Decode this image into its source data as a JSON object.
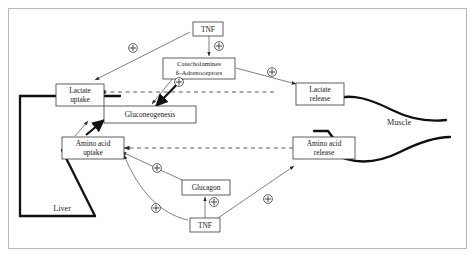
{
  "figure": {
    "frame_color": "#b9b9b9",
    "background": "#ffffff"
  },
  "tissues": [
    {
      "name": "liver-label",
      "label": "Liver",
      "x": 62,
      "y": 209
    },
    {
      "name": "muscle-label",
      "label": "Muscle",
      "x": 399,
      "y": 123
    }
  ],
  "nodes": [
    {
      "name": "tnf-top",
      "id": "tnf_top",
      "label": "TNF",
      "lines": [
        "TNF"
      ],
      "x": 193,
      "y": 22,
      "w": 30,
      "h": 14
    },
    {
      "name": "catecholamines",
      "id": "catecholamines",
      "label": "Catecholamines ß-Adrenoceptors",
      "lines": [
        "Catecholamines",
        "ß-Adrenoceptors"
      ],
      "x": 163,
      "y": 58,
      "w": 72,
      "h": 21
    },
    {
      "name": "lactate-uptake",
      "id": "lactate_uptake",
      "label": "Lactate uptake",
      "lines": [
        "Lactate",
        "uptake"
      ],
      "x": 68,
      "y": 84,
      "w": 48,
      "h": 22
    },
    {
      "name": "lactate-release",
      "id": "lactate_release",
      "label": "Lactate release",
      "lines": [
        "Lactate",
        "release"
      ],
      "x": 300,
      "y": 83,
      "w": 48,
      "h": 22
    },
    {
      "name": "gluconeogenesis",
      "id": "gluconeogenesis",
      "label": "Gluconeogenesis",
      "lines": [
        "Gluconeogenesis"
      ],
      "x": 102,
      "y": 110,
      "w": 92,
      "h": 17
    },
    {
      "name": "amino-acid-uptake",
      "id": "aa_uptake",
      "label": "Amino acid uptake",
      "lines": [
        "Amino acid",
        "uptake"
      ],
      "x": 58,
      "y": 139,
      "w": 62,
      "h": 22
    },
    {
      "name": "amino-acid-release",
      "id": "aa_release",
      "label": "Amino acid release",
      "lines": [
        "Amino acid",
        "release"
      ],
      "x": 297,
      "y": 139,
      "w": 62,
      "h": 22
    },
    {
      "name": "glucagon",
      "id": "glucagon",
      "label": "Glucagon",
      "lines": [
        "Glucagon"
      ],
      "x": 183,
      "y": 182,
      "w": 48,
      "h": 15
    },
    {
      "name": "tnf-bottom",
      "id": "tnf_bottom",
      "label": "TNF",
      "lines": [
        "TNF"
      ],
      "x": 190,
      "y": 220,
      "w": 30,
      "h": 14
    }
  ],
  "markers": [
    {
      "name": "plus-marker-tnf-to-lactate-uptake",
      "symbol": "+",
      "x": 133,
      "y": 48
    },
    {
      "name": "plus-marker-tnf-to-catecholamines",
      "symbol": "+",
      "x": 210,
      "y": 56
    },
    {
      "name": "plus-marker-catecholamines-to-muscle",
      "symbol": "+",
      "x": 272,
      "y": 72
    },
    {
      "name": "plus-marker-catecholamines-to-gluconeo",
      "symbol": "+",
      "x": 179,
      "y": 82
    },
    {
      "name": "plus-marker-glucagon-to-aa-uptake",
      "symbol": "+",
      "x": 157,
      "y": 168
    },
    {
      "name": "plus-marker-tnf-to-glucagon",
      "symbol": "+",
      "x": 209,
      "y": 200
    },
    {
      "name": "plus-marker-tnf-to-aa-uptake",
      "symbol": "+",
      "x": 156,
      "y": 208
    },
    {
      "name": "plus-marker-tnf-to-aa-release",
      "symbol": "+",
      "x": 268,
      "y": 199
    }
  ],
  "connections": [
    {
      "name": "edge-tnf-to-lactate-uptake",
      "from": "tnf_top",
      "to": "lactate_uptake",
      "style": "solid-thin",
      "sign": "+"
    },
    {
      "name": "edge-tnf-to-catecholamines",
      "from": "tnf_top",
      "to": "catecholamines",
      "style": "solid-thin",
      "sign": "+"
    },
    {
      "name": "edge-catecholamines-to-lactate-release",
      "from": "catecholamines",
      "to": "lactate_release",
      "style": "solid-thin",
      "sign": "+"
    },
    {
      "name": "edge-catecholamines-to-gluconeogenesis",
      "from": "catecholamines",
      "to": "gluconeogenesis",
      "style": "solid-thick",
      "sign": "+"
    },
    {
      "name": "edge-lactate-release-to-lactate-uptake",
      "from": "lactate_release",
      "to": "lactate_uptake",
      "style": "dashed",
      "sign": ""
    },
    {
      "name": "edge-lactate-uptake-to-gluconeogenesis",
      "from": "lactate_uptake",
      "to": "gluconeogenesis",
      "style": "solid-thick",
      "sign": ""
    },
    {
      "name": "edge-aa-uptake-to-gluconeogenesis",
      "from": "aa_uptake",
      "to": "gluconeogenesis",
      "style": "solid-thick",
      "sign": ""
    },
    {
      "name": "edge-aa-release-to-aa-uptake",
      "from": "aa_release",
      "to": "aa_uptake",
      "style": "dashed",
      "sign": ""
    },
    {
      "name": "edge-glucagon-to-aa-uptake",
      "from": "glucagon",
      "to": "aa_uptake",
      "style": "solid-thin",
      "sign": "+"
    },
    {
      "name": "edge-tnf-bottom-to-glucagon",
      "from": "tnf_bottom",
      "to": "glucagon",
      "style": "solid-thin",
      "sign": "+"
    },
    {
      "name": "edge-tnf-bottom-to-aa-uptake",
      "from": "tnf_bottom",
      "to": "aa_uptake",
      "style": "solid-thin-curve",
      "sign": "+"
    },
    {
      "name": "edge-tnf-bottom-to-aa-release",
      "from": "tnf_bottom",
      "to": "aa_release",
      "style": "solid-thin",
      "sign": "+"
    }
  ]
}
